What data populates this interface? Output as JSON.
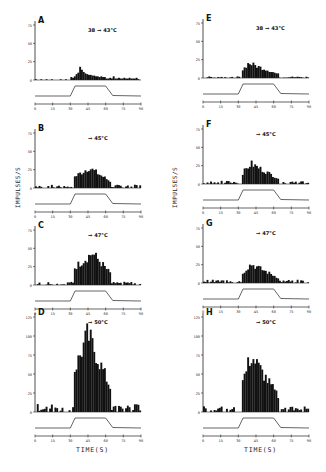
{
  "figure": {
    "ylabel": "IMPULSES/S",
    "xlabel": "TIME(S)"
  },
  "chart_data": {
    "type": "bar",
    "title": "",
    "xlabel": "TIME(S)",
    "ylabel": "IMPULSES/S",
    "x_ticks": [
      0,
      15,
      30,
      45,
      60,
      75,
      90
    ],
    "xlim": [
      0,
      90
    ],
    "grid": false,
    "legend": "none",
    "panels": [
      {
        "id": "A",
        "column": "left",
        "stimulus": "38 → 43°C",
        "ylim": [
          0,
          75
        ],
        "y_ticks": [
          0,
          25,
          50,
          75
        ],
        "peak_time_s": 42,
        "peak_rate": 18,
        "baseline": 1,
        "profile": [
          1,
          0,
          0,
          1,
          0,
          0,
          1,
          0,
          0,
          1,
          0,
          0,
          0,
          0,
          1,
          0,
          0,
          1,
          0,
          0,
          4,
          3,
          5,
          8,
          10,
          18,
          14,
          11,
          9,
          8,
          7,
          7,
          6,
          6,
          5,
          5,
          4,
          5,
          4,
          4,
          2,
          2,
          3,
          2,
          5,
          2,
          2,
          3,
          2,
          2,
          3,
          2,
          2,
          3,
          2,
          2,
          2,
          3
        ]
      },
      {
        "id": "B",
        "column": "left",
        "stimulus": "→ 45°C",
        "ylim": [
          0,
          75
        ],
        "y_ticks": [
          0,
          25,
          50,
          75
        ],
        "peak_time_s": 45,
        "peak_rate": 30
      },
      {
        "id": "C",
        "column": "left",
        "stimulus": "→ 47°C",
        "ylim": [
          0,
          75
        ],
        "y_ticks": [
          0,
          25,
          50,
          75
        ],
        "peak_time_s": 48,
        "peak_rate": 47
      },
      {
        "id": "D",
        "column": "left",
        "stimulus": "→ 50°C",
        "ylim": [
          0,
          125
        ],
        "y_ticks": [
          0,
          25,
          50,
          75,
          100,
          125
        ],
        "peak_time_s": 44,
        "peak_rate": 110
      },
      {
        "id": "E",
        "column": "right",
        "stimulus": "38 → 43°C",
        "ylim": [
          0,
          75
        ],
        "y_ticks": [
          0,
          25,
          50,
          75
        ],
        "peak_time_s": 38,
        "peak_rate": 22
      },
      {
        "id": "F",
        "column": "right",
        "stimulus": "→ 45°C",
        "ylim": [
          0,
          75
        ],
        "y_ticks": [
          0,
          25,
          50,
          75
        ],
        "peak_time_s": 40,
        "peak_rate": 30
      },
      {
        "id": "G",
        "column": "right",
        "stimulus": "→ 47°C",
        "ylim": [
          0,
          75
        ],
        "y_ticks": [
          0,
          25,
          50,
          75
        ],
        "peak_time_s": 40,
        "peak_rate": 28
      },
      {
        "id": "H",
        "column": "right",
        "stimulus": "→ 50°C",
        "ylim": [
          0,
          125
        ],
        "y_ticks": [
          0,
          25,
          50,
          75,
          100,
          125
        ],
        "peak_time_s": 40,
        "peak_rate": 80
      }
    ],
    "stimulus_trace": {
      "description": "temperature step trace below each histogram",
      "rise_start_s": 30,
      "plateau_start_s": 34,
      "plateau_end_s": 60,
      "fall_end_s": 66
    }
  }
}
